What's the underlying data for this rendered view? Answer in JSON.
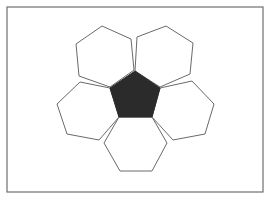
{
  "diagram": {
    "frame": {
      "x": 7,
      "y": 7,
      "width": 256,
      "height": 185,
      "stroke": "#6e6e6e",
      "fill": "#ffffff"
    },
    "pentagon": {
      "fill": "#2b2b2b",
      "points": "135,71 160,88 152,117 119,117 110,88"
    },
    "hexagons": [
      {
        "id": "top-left",
        "fill": "#ffffff",
        "stroke": "#6a6a6a",
        "points": "102,26 131,39 134,70 110,87 79,76 76,44"
      },
      {
        "id": "top-right",
        "fill": "#ffffff",
        "stroke": "#6a6a6a",
        "points": "166,26 193,43 190,74 160,87 135,71 137,37"
      },
      {
        "id": "left",
        "fill": "#ffffff",
        "stroke": "#6a6a6a",
        "points": "80,82 110,88 119,117 99,140 67,134 57,104"
      },
      {
        "id": "right",
        "fill": "#ffffff",
        "stroke": "#6a6a6a",
        "points": "192,81 214,104 205,134 173,140 152,117 160,88"
      },
      {
        "id": "bottom",
        "fill": "#ffffff",
        "stroke": "#6a6a6a",
        "points": "119,117 152,117 167,143 152,171 120,171 104,143"
      }
    ]
  }
}
